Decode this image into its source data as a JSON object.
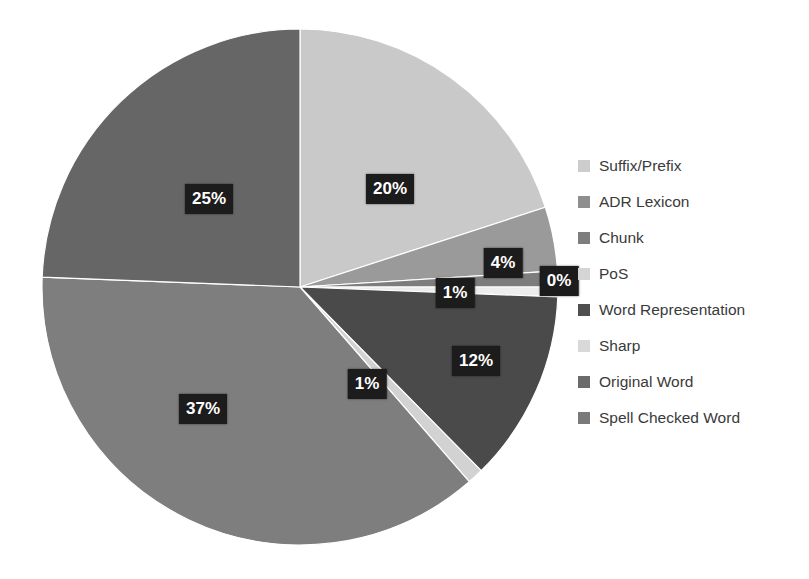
{
  "chart_data": {
    "type": "pie",
    "title": "",
    "legend_position": "right",
    "categories": [
      "Suffix/Prefix",
      "ADR Lexicon",
      "Chunk",
      "PoS",
      "Word Representation",
      "Sharp",
      "Original Word",
      "Spell Checked Word"
    ],
    "values": [
      20,
      4,
      1,
      0,
      12,
      1,
      37,
      25
    ],
    "value_labels": [
      "20%",
      "4%",
      "1%",
      "0%",
      "12%",
      "1%",
      "37%",
      "25%"
    ],
    "colors": [
      "#c9c9c9",
      "#9a9a9a",
      "#7d7d7d",
      "#ededed",
      "#4a4a4a",
      "#d2d2d2",
      "#666666",
      "#7e7e7e"
    ],
    "slice_order_clockwise_from_top": [
      "Suffix/Prefix",
      "ADR Lexicon",
      "Chunk",
      "PoS",
      "Word Representation",
      "Sharp",
      "Spell Checked Word",
      "Original Word"
    ]
  },
  "pie": {
    "center_x": 300,
    "center_y": 287,
    "radius": 258,
    "slices": [
      {
        "name": "Suffix/Prefix",
        "percent": 20,
        "label": "20%",
        "color": "#c9c9c9",
        "start": 0,
        "end": 72.0,
        "label_x": 390,
        "label_y": 189
      },
      {
        "name": "ADR Lexicon",
        "percent": 4,
        "label": "4%",
        "color": "#9a9a9a",
        "start": 72.0,
        "end": 86.4,
        "label_x": 503,
        "label_y": 263
      },
      {
        "name": "Chunk",
        "percent": 1,
        "label": "1%",
        "color": "#7d7d7d",
        "start": 86.4,
        "end": 90.0,
        "label_x": 455,
        "label_y": 293
      },
      {
        "name": "PoS",
        "percent": 0,
        "label": "0%",
        "color": "#ededed",
        "start": 90.0,
        "end": 92.2,
        "label_x": 559,
        "label_y": 281
      },
      {
        "name": "Word Representation",
        "percent": 12,
        "label": "12%",
        "color": "#4a4a4a",
        "start": 92.2,
        "end": 135.4,
        "label_x": 476,
        "label_y": 361
      },
      {
        "name": "Sharp",
        "percent": 1,
        "label": "1%",
        "color": "#d2d2d2",
        "start": 135.4,
        "end": 139.0,
        "label_x": 367,
        "label_y": 384
      },
      {
        "name": "Spell Checked Word",
        "percent": 37,
        "label": "37%",
        "color": "#7e7e7e",
        "start": 139.0,
        "end": 272.2,
        "label_x": 203,
        "label_y": 409
      },
      {
        "name": "Original Word",
        "percent": 25,
        "label": "25%",
        "color": "#666666",
        "start": 272.2,
        "end": 360.0,
        "label_x": 209,
        "label_y": 199
      }
    ]
  },
  "legend": {
    "items": [
      {
        "label": "Suffix/Prefix",
        "color": "#cdcdcd"
      },
      {
        "label": "ADR Lexicon",
        "color": "#8f8f8f"
      },
      {
        "label": "Chunk",
        "color": "#7e7e7e"
      },
      {
        "label": "PoS",
        "color": "#d5d5d5"
      },
      {
        "label": "Word Representation",
        "color": "#4f4f4f"
      },
      {
        "label": "Sharp",
        "color": "#d9d9d9"
      },
      {
        "label": "Original Word",
        "color": "#6b6b6b"
      },
      {
        "label": "Spell Checked Word",
        "color": "#7a7a7a"
      }
    ]
  }
}
